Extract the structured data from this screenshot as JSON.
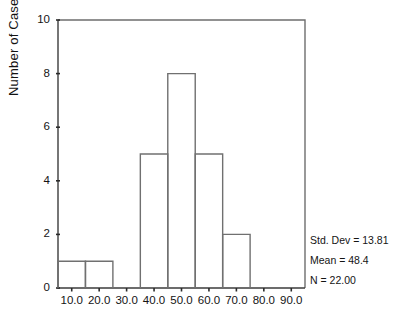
{
  "chart_data": {
    "type": "bar",
    "title": "",
    "subtitle": "",
    "xlabel": "",
    "ylabel": "Number of Cases",
    "grid": false,
    "legend": null,
    "xlim": [
      5,
      95
    ],
    "ylim": [
      0,
      10
    ],
    "bin_width": 10,
    "x_tick_labels": [
      "10.0",
      "20.0",
      "30.0",
      "40.0",
      "50.0",
      "60.0",
      "70.0",
      "80.0",
      "90.0"
    ],
    "x_tick_values": [
      10,
      20,
      30,
      40,
      50,
      60,
      70,
      80,
      90
    ],
    "y_tick_labels": [
      "0",
      "2",
      "4",
      "6",
      "8",
      "10"
    ],
    "y_tick_values": [
      0,
      2,
      4,
      6,
      8,
      10
    ],
    "categories": [
      "10.0",
      "20.0",
      "30.0",
      "40.0",
      "50.0",
      "60.0",
      "70.0",
      "80.0",
      "90.0"
    ],
    "values": [
      1,
      1,
      0,
      5,
      8,
      5,
      2,
      0,
      0
    ],
    "bins": [
      {
        "center": 10,
        "low": 5,
        "high": 15,
        "count": 1
      },
      {
        "center": 20,
        "low": 15,
        "high": 25,
        "count": 1
      },
      {
        "center": 30,
        "low": 25,
        "high": 35,
        "count": 0
      },
      {
        "center": 40,
        "low": 35,
        "high": 45,
        "count": 5
      },
      {
        "center": 50,
        "low": 45,
        "high": 55,
        "count": 8
      },
      {
        "center": 60,
        "low": 55,
        "high": 65,
        "count": 5
      },
      {
        "center": 70,
        "low": 65,
        "high": 75,
        "count": 2
      },
      {
        "center": 80,
        "low": 75,
        "high": 85,
        "count": 0
      },
      {
        "center": 90,
        "low": 85,
        "high": 95,
        "count": 0
      }
    ],
    "annotations": [
      "Std. Dev = 13.81",
      "Mean = 48.4",
      "N = 22.00"
    ],
    "colors": {
      "background": "#ffffff",
      "bar_outline": "#707070",
      "bar_fill": "none",
      "axis": "#3d3d3d",
      "frame": "#6e6e6e",
      "text": "#141414"
    }
  },
  "stats": {
    "std_dev": "Std. Dev = 13.81",
    "mean": "Mean = 48.4",
    "n": "N = 22.00"
  },
  "axes": {
    "y_axis_title": "Number of Cases"
  }
}
